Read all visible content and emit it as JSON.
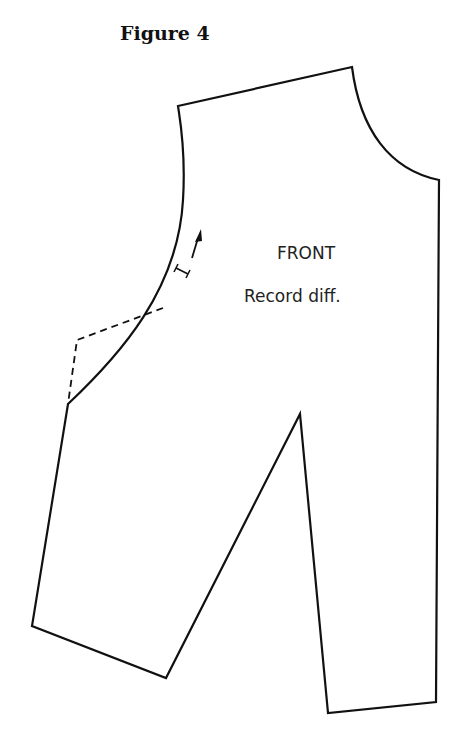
{
  "figure": {
    "title": "Figure 4"
  },
  "pattern_piece": {
    "name": "FRONT",
    "instruction": "Record diff.",
    "stroke_color": "#111111",
    "background": "#ffffff"
  }
}
